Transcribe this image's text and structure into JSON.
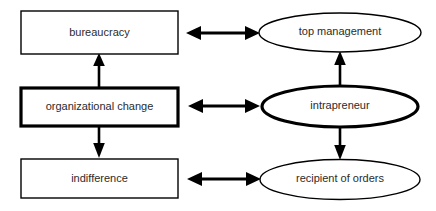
{
  "diagram": {
    "type": "block-diagram",
    "background_color": "#ffffff",
    "stroke_color": "#000000",
    "text_color": "#2b2b2b",
    "nodes": [
      {
        "id": "bureaucracy",
        "label": "bureaucracy",
        "shape": "rectangle",
        "emphasis": "normal",
        "column": "left",
        "row": "top"
      },
      {
        "id": "organizational-change",
        "label": "organizational change",
        "shape": "rectangle",
        "emphasis": "bold",
        "column": "left",
        "row": "middle"
      },
      {
        "id": "indifference",
        "label": "indifference",
        "shape": "rectangle",
        "emphasis": "normal",
        "column": "left",
        "row": "bottom"
      },
      {
        "id": "top-management",
        "label": "top management",
        "shape": "ellipse",
        "emphasis": "normal",
        "column": "right",
        "row": "top"
      },
      {
        "id": "intrapreneur",
        "label": "intrapreneur",
        "shape": "ellipse",
        "emphasis": "bold",
        "column": "right",
        "row": "middle"
      },
      {
        "id": "recipient-of-orders",
        "label": "recipient of orders",
        "shape": "ellipse",
        "emphasis": "normal",
        "column": "right",
        "row": "bottom"
      }
    ],
    "connectors": [
      {
        "id": "organizational-change-to-bureaucracy",
        "from": "organizational-change",
        "to": "bureaucracy",
        "direction": "up",
        "arrows": "single"
      },
      {
        "id": "organizational-change-to-indifference",
        "from": "organizational-change",
        "to": "indifference",
        "direction": "down",
        "arrows": "single"
      },
      {
        "id": "intrapreneur-to-top-management",
        "from": "intrapreneur",
        "to": "top-management",
        "direction": "up",
        "arrows": "single"
      },
      {
        "id": "intrapreneur-to-recipient-of-orders",
        "from": "intrapreneur",
        "to": "recipient-of-orders",
        "direction": "down",
        "arrows": "single"
      },
      {
        "id": "bureaucracy-top-management",
        "from": "bureaucracy",
        "to": "top-management",
        "direction": "horizontal",
        "arrows": "double"
      },
      {
        "id": "organizational-change-intrapreneur",
        "from": "organizational-change",
        "to": "intrapreneur",
        "direction": "horizontal",
        "arrows": "double"
      },
      {
        "id": "indifference-recipient-of-orders",
        "from": "indifference",
        "to": "recipient-of-orders",
        "direction": "horizontal",
        "arrows": "double"
      }
    ]
  }
}
